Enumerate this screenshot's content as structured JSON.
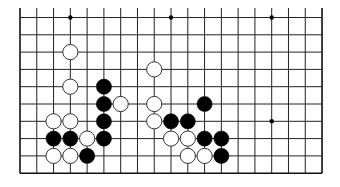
{
  "board": {
    "size": 19,
    "visible_rows": [
      9,
      18
    ],
    "visible_cols": [
      0,
      18
    ],
    "origin_x": 20,
    "col_spacing": 16.78,
    "bottom_y": 173.2,
    "row_spacing": 17.3,
    "top_line_extend_to": 8,
    "line_color": "#222222",
    "edge_color": "#111111",
    "background": "#ffffff",
    "stone_radius": 7.6,
    "star_points": [
      [
        3,
        9
      ],
      [
        9,
        9
      ],
      [
        15,
        9
      ],
      [
        15,
        15
      ]
    ],
    "stones": [
      {
        "color": "white",
        "col": 3,
        "row": 11
      },
      {
        "color": "white",
        "col": 3,
        "row": 13
      },
      {
        "color": "black",
        "col": 5,
        "row": 13
      },
      {
        "color": "black",
        "col": 5,
        "row": 14
      },
      {
        "color": "white",
        "col": 6,
        "row": 14
      },
      {
        "color": "white",
        "col": 2,
        "row": 15
      },
      {
        "color": "white",
        "col": 3,
        "row": 15
      },
      {
        "color": "black",
        "col": 5,
        "row": 15
      },
      {
        "color": "black",
        "col": 2,
        "row": 16
      },
      {
        "color": "black",
        "col": 3,
        "row": 16
      },
      {
        "color": "white",
        "col": 4,
        "row": 16
      },
      {
        "color": "black",
        "col": 5,
        "row": 16
      },
      {
        "color": "white",
        "col": 2,
        "row": 17
      },
      {
        "color": "white",
        "col": 3,
        "row": 17
      },
      {
        "color": "black",
        "col": 4,
        "row": 17
      },
      {
        "color": "white",
        "col": 8,
        "row": 12
      },
      {
        "color": "white",
        "col": 8,
        "row": 14
      },
      {
        "color": "black",
        "col": 11,
        "row": 14
      },
      {
        "color": "white",
        "col": 8,
        "row": 15
      },
      {
        "color": "black",
        "col": 9,
        "row": 15
      },
      {
        "color": "black",
        "col": 10,
        "row": 15
      },
      {
        "color": "white",
        "col": 9,
        "row": 16
      },
      {
        "color": "white",
        "col": 10,
        "row": 16
      },
      {
        "color": "black",
        "col": 11,
        "row": 16
      },
      {
        "color": "black",
        "col": 12,
        "row": 16
      },
      {
        "color": "white",
        "col": 10,
        "row": 17
      },
      {
        "color": "white",
        "col": 11,
        "row": 17
      },
      {
        "color": "black",
        "col": 12,
        "row": 17
      }
    ]
  }
}
